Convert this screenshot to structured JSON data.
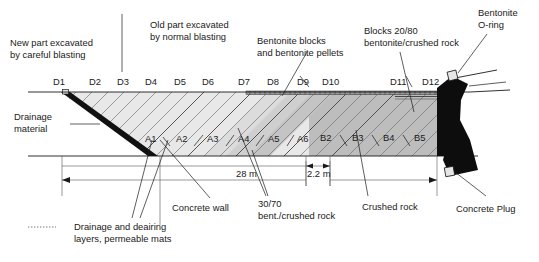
{
  "figure": {
    "title_annotations": [
      {
        "id": "new-part",
        "lines": [
          "New part excavated",
          "by careful blasting"
        ]
      },
      {
        "id": "old-part",
        "lines": [
          "Old part excavated",
          "by normal blasting"
        ]
      },
      {
        "id": "bentonite-blocks",
        "lines": [
          "Bentonite blocks",
          "and bentonite pellets"
        ]
      },
      {
        "id": "blocks-2080",
        "lines": [
          "Blocks 20/80",
          "bentonite/crushed rock"
        ]
      },
      {
        "id": "bentonite-oring",
        "lines": [
          "Bentonite",
          "O-ring"
        ]
      },
      {
        "id": "drainage-material",
        "lines": [
          "Drainage",
          "material"
        ]
      },
      {
        "id": "drainage-deairing",
        "lines": [
          "Drainage and deairing",
          "layers, permeable mats"
        ]
      },
      {
        "id": "concrete-wall",
        "lines": [
          "Concrete wall"
        ]
      },
      {
        "id": "bent-crushed-rock",
        "lines": [
          "30/70",
          "bent./crushed rock"
        ]
      },
      {
        "id": "crushed-rock",
        "lines": [
          "Crushed rock"
        ]
      },
      {
        "id": "concrete-plug",
        "lines": [
          "Concrete Plug"
        ]
      }
    ],
    "top_station_labels": [
      "D1",
      "D2",
      "D3",
      "D4",
      "D5",
      "D6",
      "D7",
      "D8",
      "D9",
      "D10",
      "D11",
      "D12"
    ],
    "zone_labels": [
      "A1",
      "A2",
      "A3",
      "A4",
      "A5",
      "A6",
      "B2",
      "B3",
      "B4",
      "B5"
    ],
    "dimensions": [
      {
        "id": "length-28m",
        "label": "28 m"
      },
      {
        "id": "length-2p2m",
        "label": "2.2 m"
      }
    ],
    "colors": {
      "zone_a_fill": "#e8e8e8",
      "zone_b_fill": "#bdbdbd",
      "plug_fill": "#0d0d0d",
      "drainage_wedge": "#111111",
      "outline": "#1a1a1a",
      "hatch": "#6d6d6d",
      "background": "#ffffff"
    }
  }
}
